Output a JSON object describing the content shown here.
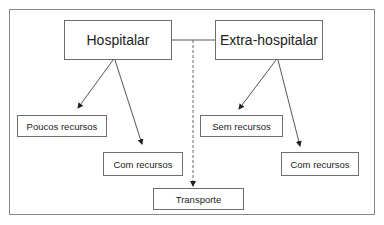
{
  "diagram": {
    "nodes": {
      "hospitalar": "Hospitalar",
      "extra_hospitalar": "Extra-hospitalar",
      "poucos_recursos": "Poucos recursos",
      "com_recursos_left": "Com recursos",
      "transporte": "Transporte",
      "sem_recursos": "Sem recursos",
      "com_recursos_right": "Com recursos"
    },
    "edges": [
      {
        "from": "hospitalar",
        "to": "poucos_recursos",
        "style": "solid-arrow"
      },
      {
        "from": "hospitalar",
        "to": "com_recursos_left",
        "style": "solid-arrow"
      },
      {
        "from": "extra_hospitalar",
        "to": "sem_recursos",
        "style": "solid-arrow"
      },
      {
        "from": "extra_hospitalar",
        "to": "com_recursos_right",
        "style": "solid-arrow"
      },
      {
        "from": "hospitalar",
        "to": "extra_hospitalar",
        "style": "solid-line"
      },
      {
        "from": "hospitalar-extra_hospitalar-link",
        "to": "transporte",
        "style": "dashed-arrow"
      }
    ]
  }
}
